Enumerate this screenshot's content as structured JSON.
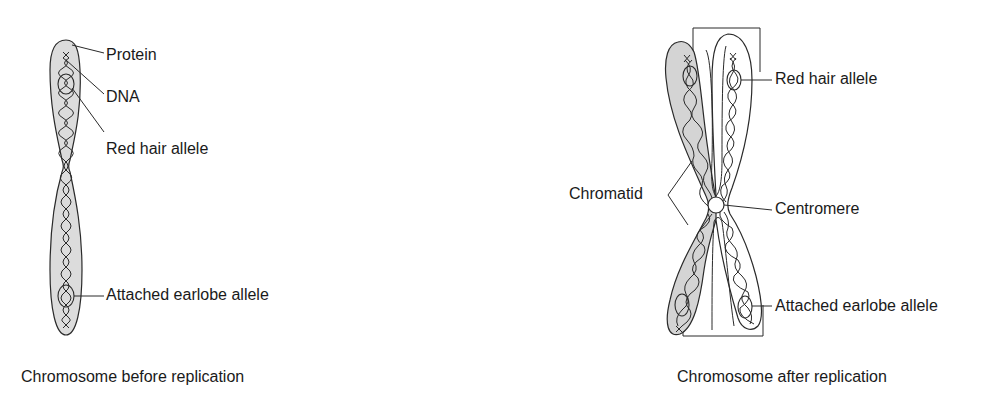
{
  "diagram": {
    "left": {
      "caption": "Chromosome before replication",
      "labels": {
        "protein": "Protein",
        "dna": "DNA",
        "red_hair": "Red hair allele",
        "earlobe": "Attached earlobe allele"
      }
    },
    "right": {
      "caption": "Chromosome after replication",
      "labels": {
        "red_hair": "Red hair allele",
        "chromatid": "Chromatid",
        "centromere": "Centromere",
        "earlobe": "Attached earlobe allele"
      }
    },
    "colors": {
      "outline": "#2a2a2a",
      "shade": "#d9d9d9",
      "text": "#1a1a1a"
    }
  }
}
